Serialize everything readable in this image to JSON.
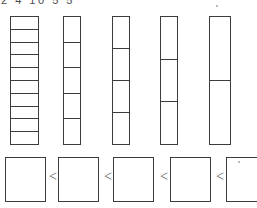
{
  "header": {
    "numbers_label": "2 4 10 5 5"
  },
  "bars": {
    "unit_label": "bar-segment",
    "columns": [
      {
        "name": "bar-column-1",
        "segments": 10,
        "left": 10,
        "width": 29,
        "height": 129
      },
      {
        "name": "bar-column-2",
        "segments": 5,
        "left": 63,
        "width": 18,
        "height": 129
      },
      {
        "name": "bar-column-3",
        "segments": 4,
        "left": 112,
        "width": 18,
        "height": 129
      },
      {
        "name": "bar-column-4",
        "segments": 3,
        "left": 160,
        "width": 18,
        "height": 129
      },
      {
        "name": "bar-column-5",
        "segments": 2,
        "left": 209,
        "width": 22,
        "height": 129
      }
    ]
  },
  "compare": {
    "operator": "<",
    "boxes": [
      {
        "name": "answer-box-1",
        "value": "",
        "left": 5,
        "width": 41
      },
      {
        "name": "answer-box-2",
        "value": "",
        "left": 58,
        "width": 41
      },
      {
        "name": "answer-box-3",
        "value": "",
        "left": 113,
        "width": 41
      },
      {
        "name": "answer-box-4",
        "value": "",
        "left": 170,
        "width": 41
      },
      {
        "name": "answer-box-5",
        "value": "",
        "left": 226,
        "width": 41
      }
    ],
    "operators": [
      {
        "name": "compare-operator-1",
        "left": 47
      },
      {
        "name": "compare-operator-2",
        "left": 102
      },
      {
        "name": "compare-operator-3",
        "left": 158
      },
      {
        "name": "compare-operator-4",
        "left": 214
      }
    ]
  },
  "artifacts": {
    "specks": [
      {
        "name": "scan-speck-1",
        "left": 238,
        "top": 161
      },
      {
        "name": "scan-speck-2",
        "left": 216,
        "top": 5
      }
    ]
  },
  "colors": {
    "ink": "#3c3c3c",
    "paper": "#ffffff",
    "operator": "#555555"
  }
}
